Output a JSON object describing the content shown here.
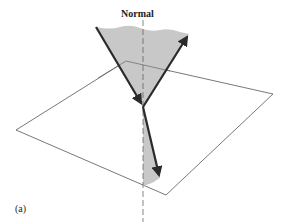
{
  "diagram": {
    "normal_label": "Normal",
    "figure_label": "(a)",
    "colors": {
      "wedge_fill": "#c8c8c8",
      "ray": "#2a2a2a",
      "plane_line": "#555555",
      "normal_line": "#555555"
    },
    "elements": [
      "interface-plane",
      "normal-line",
      "incident-ray",
      "reflected-ray",
      "refracted-ray",
      "shaded-reflection-wedge",
      "shaded-refraction-wedge"
    ]
  }
}
